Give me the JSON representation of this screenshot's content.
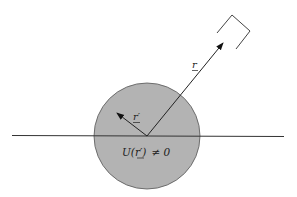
{
  "diagram": {
    "labels": {
      "r": "r",
      "r_prime": "r′",
      "potential": "U(r′) ≠ 0"
    },
    "potential_parts": {
      "func": "U(",
      "arg": "r′",
      "close": ")",
      "rel": "≠ 0"
    },
    "colors": {
      "sphere_fill": "#b3b3b3",
      "sphere_stroke": "#444444",
      "line": "#333333"
    }
  }
}
